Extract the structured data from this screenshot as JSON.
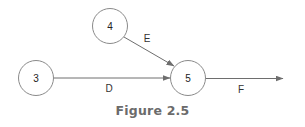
{
  "diagram": {
    "type": "activity-on-arrow network",
    "nodes": [
      {
        "id": "3",
        "label": "3",
        "cx": 36,
        "cy": 78,
        "r": 17.5
      },
      {
        "id": "4",
        "label": "4",
        "cx": 110,
        "cy": 26,
        "r": 17.5
      },
      {
        "id": "5",
        "label": "5",
        "cx": 188,
        "cy": 78,
        "r": 17.5
      }
    ],
    "edges": [
      {
        "id": "D",
        "label": "D",
        "from": "3",
        "to": "5"
      },
      {
        "id": "E",
        "label": "E",
        "from": "4",
        "to": "5"
      },
      {
        "id": "F",
        "label": "F",
        "from": "5",
        "to": null
      }
    ],
    "colors": {
      "stroke": "#8a8a8a",
      "arrow": "#6e6e6e",
      "caption": "#6b6b6b"
    }
  },
  "caption": "Figure 2.5"
}
